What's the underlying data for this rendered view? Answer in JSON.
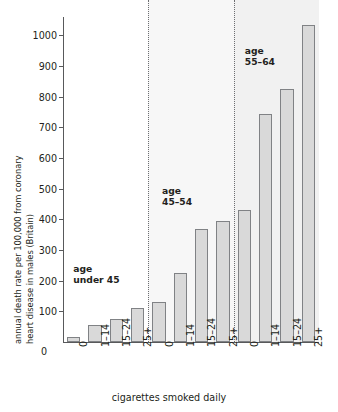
{
  "chart_data": {
    "type": "bar",
    "title": "",
    "xlabel": "cigarettes smoked daily",
    "ylabel": "annual death rate per 100,000 from coronary heart disease in males (Britain)",
    "ylabel_line1": "annual death rate per 100,000 from coronary",
    "ylabel_line2": "heart disease in males (Britain)",
    "ylim": [
      0,
      1060
    ],
    "ytick_labels": [
      "100",
      "200",
      "300",
      "400",
      "500",
      "600",
      "700",
      "800",
      "900",
      "1000"
    ],
    "ytick_values": [
      100,
      200,
      300,
      400,
      500,
      600,
      700,
      800,
      900,
      1000
    ],
    "y_origin_label": "0",
    "grid": false,
    "legend": "none",
    "categories": [
      "0",
      "1–14",
      "15–24",
      "25+"
    ],
    "groups": [
      {
        "name": "age under 45",
        "annotation_line1": "age",
        "annotation_line2": "under 45",
        "values": [
          15,
          55,
          75,
          110
        ]
      },
      {
        "name": "age 45–54",
        "annotation_line1": "age",
        "annotation_line2": "45–54",
        "values": [
          130,
          225,
          370,
          395
        ]
      },
      {
        "name": "age 55–64",
        "annotation_line1": "age",
        "annotation_line2": "55–64",
        "values": [
          430,
          745,
          825,
          1035
        ]
      }
    ],
    "x_tick_labels": [
      "0",
      "1–14",
      "15–24",
      "25+",
      "0",
      "1–14",
      "15–24",
      "25+",
      "0",
      "1–14",
      "15–24",
      "25+"
    ],
    "colors": {
      "bar_fill": "#d9d9d9",
      "bar_stroke": "#808285",
      "axis": "#58595b",
      "text": "#231f20",
      "band2": "#f7f7f7",
      "band3": "#f1f1f1",
      "divider": "#6d6e71"
    }
  }
}
